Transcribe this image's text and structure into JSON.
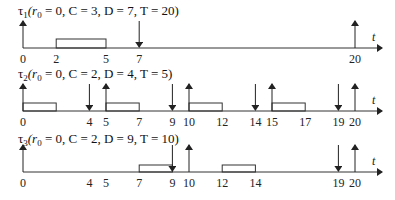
{
  "diagram": {
    "time_axis_label": "t",
    "x_origin_px": 23,
    "px_per_unit": 16.6,
    "axis_end_px": 382,
    "rows": [
      {
        "id": "tau1",
        "title_sym": "τ",
        "title_sub": "1",
        "title_rest": "(r",
        "title_rsub": "0",
        "title_params": " = 0, C = 3, D = 7, T = 20)",
        "axis_y": 48,
        "box_top_y": 39,
        "releases": [
          0,
          20
        ],
        "deadlines": [
          7
        ],
        "executions": [
          [
            2,
            5
          ]
        ],
        "tick_labels": [
          "0",
          "2",
          "5",
          "7",
          "20"
        ],
        "tick_values": [
          0,
          2,
          5,
          7,
          20
        ]
      },
      {
        "id": "tau2",
        "title_sym": "τ",
        "title_sub": "2",
        "title_rest": "(r",
        "title_rsub": "0",
        "title_params": " = 0, C = 2, D = 4, T = 5)",
        "axis_y": 111,
        "box_top_y": 103,
        "releases": [
          0,
          5,
          10,
          15,
          20
        ],
        "deadlines": [
          4,
          9,
          14,
          19
        ],
        "executions": [
          [
            0,
            2
          ],
          [
            5,
            7
          ],
          [
            10,
            12
          ],
          [
            15,
            17
          ]
        ],
        "tick_labels": [
          "0",
          "4",
          "5",
          "7",
          "9",
          "10",
          "12",
          "14",
          "15",
          "17",
          "19",
          "20"
        ],
        "tick_values": [
          0,
          4,
          5,
          7,
          9,
          10,
          12,
          14,
          15,
          17,
          19,
          20
        ]
      },
      {
        "id": "tau3",
        "title_sym": "τ",
        "title_sub": "3",
        "title_rest": "(r",
        "title_rsub": "0",
        "title_params": " = 0, C = 2, D = 9, T = 10)",
        "axis_y": 172,
        "box_top_y": 165,
        "releases": [
          0,
          10,
          20
        ],
        "deadlines": [
          9,
          19
        ],
        "executions": [
          [
            7,
            9
          ],
          [
            12,
            14
          ]
        ],
        "tick_labels": [
          "0",
          "4",
          "5",
          "7",
          "9",
          "10",
          "12",
          "14",
          "19",
          "20"
        ],
        "tick_values": [
          0,
          4,
          5,
          7,
          9,
          10,
          12,
          14,
          19,
          20
        ]
      }
    ]
  }
}
